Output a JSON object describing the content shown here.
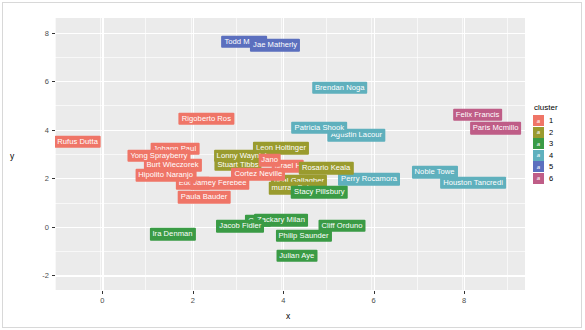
{
  "chart_data": {
    "type": "scatter",
    "title": "",
    "xlabel": "x",
    "ylabel": "y",
    "xlim": [
      -1.05,
      9.35
    ],
    "ylim": [
      -2.6,
      8.6
    ],
    "xticks": [
      "0",
      "2",
      "4",
      "6",
      "8"
    ],
    "xtick_values": [
      0,
      2,
      4,
      6,
      8
    ],
    "yticks": [
      "8",
      "6",
      "4",
      "2",
      "0",
      "-2"
    ],
    "ytick_values": [
      8,
      6,
      4,
      2,
      0,
      -2
    ],
    "grid": true,
    "legend_position": "right",
    "legend_title": "cluster",
    "legend_key_glyph": "a",
    "legend_entries": [
      {
        "label": "1",
        "color": "#ef7567"
      },
      {
        "label": "2",
        "color": "#9a9b2e"
      },
      {
        "label": "3",
        "color": "#3a9b45"
      },
      {
        "label": "4",
        "color": "#5fb0bd"
      },
      {
        "label": "5",
        "color": "#5b6fbe"
      },
      {
        "label": "6",
        "color": "#bf5d87"
      }
    ],
    "points": [
      {
        "label": "Todd Mangi",
        "x": 3.14,
        "y": 7.62,
        "cluster": 5
      },
      {
        "label": "Jae Matherly",
        "x": 3.82,
        "y": 7.48,
        "cluster": 5
      },
      {
        "label": "Brendan Noga",
        "x": 5.25,
        "y": 5.72,
        "cluster": 4
      },
      {
        "label": "Felix Francis",
        "x": 8.3,
        "y": 4.62,
        "cluster": 6
      },
      {
        "label": "Rigoberto Ros",
        "x": 2.3,
        "y": 4.46,
        "cluster": 1
      },
      {
        "label": "Paris Mcmillo",
        "x": 8.7,
        "y": 4.06,
        "cluster": 6
      },
      {
        "label": "Patricia Shook",
        "x": 4.8,
        "y": 4.08,
        "cluster": 4
      },
      {
        "label": "Agustin Lacour",
        "x": 5.62,
        "y": 3.78,
        "cluster": 4
      },
      {
        "label": "Rufus Dutta",
        "x": -0.55,
        "y": 3.5,
        "cluster": 1
      },
      {
        "label": "Johann Paul",
        "x": 1.6,
        "y": 3.22,
        "cluster": 1
      },
      {
        "label": "Leon Holtinger",
        "x": 3.95,
        "y": 3.24,
        "cluster": 2
      },
      {
        "label": "Yong Sprayberry",
        "x": 1.25,
        "y": 2.92,
        "cluster": 1
      },
      {
        "label": "Lonny Waynick",
        "x": 3.1,
        "y": 2.92,
        "cluster": 2
      },
      {
        "label": "Jano",
        "x": 3.7,
        "y": 2.74,
        "cluster": 1
      },
      {
        "label": "Burt Wieczorek",
        "x": 1.55,
        "y": 2.54,
        "cluster": 1
      },
      {
        "label": "Stuart Tibbs",
        "x": 3.0,
        "y": 2.56,
        "cluster": 2
      },
      {
        "label": "Israel H",
        "x": 4.1,
        "y": 2.5,
        "cluster": 1
      },
      {
        "label": "Rosario Keala",
        "x": 4.95,
        "y": 2.42,
        "cluster": 2
      },
      {
        "label": "Hipolito Naranjo",
        "x": 1.4,
        "y": 2.12,
        "cluster": 1
      },
      {
        "label": "Cortez Neville",
        "x": 3.45,
        "y": 2.16,
        "cluster": 1
      },
      {
        "label": "Noble Towe",
        "x": 7.35,
        "y": 2.24,
        "cluster": 4
      },
      {
        "label": "Perry Rocamora",
        "x": 5.9,
        "y": 1.96,
        "cluster": 4
      },
      {
        "label": "Houston Tancredi",
        "x": 8.2,
        "y": 1.82,
        "cluster": 4
      },
      {
        "label": "Eddie Al",
        "x": 2.0,
        "y": 1.8,
        "cluster": 1
      },
      {
        "label": "Jamey Ferebee",
        "x": 2.6,
        "y": 1.8,
        "cluster": 1
      },
      {
        "label": "neal Gallagher",
        "x": 4.35,
        "y": 1.88,
        "cluster": 2
      },
      {
        "label": "murray Bulmer",
        "x": 4.3,
        "y": 1.6,
        "cluster": 2
      },
      {
        "label": "Stacy Pillsbury",
        "x": 4.8,
        "y": 1.42,
        "cluster": 3
      },
      {
        "label": "Paula Bauder",
        "x": 2.25,
        "y": 1.22,
        "cluster": 1
      },
      {
        "label": "Conni",
        "x": 3.45,
        "y": 0.26,
        "cluster": 3
      },
      {
        "label": "Zackary Milan",
        "x": 3.95,
        "y": 0.28,
        "cluster": 3
      },
      {
        "label": "Cliff Orduno",
        "x": 5.3,
        "y": 0.04,
        "cluster": 3
      },
      {
        "label": "Jacob Fidler",
        "x": 3.05,
        "y": 0.02,
        "cluster": 3
      },
      {
        "label": "Ira Denman",
        "x": 1.55,
        "y": -0.3,
        "cluster": 3
      },
      {
        "label": "Philip Saunder",
        "x": 4.45,
        "y": -0.36,
        "cluster": 3
      },
      {
        "label": "Julian Aye",
        "x": 4.3,
        "y": -1.18,
        "cluster": 3
      }
    ]
  }
}
